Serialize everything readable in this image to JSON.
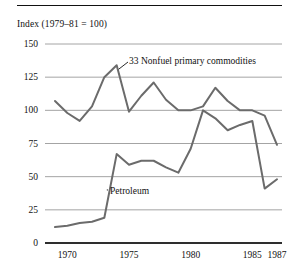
{
  "chart_data": {
    "type": "line",
    "title": "",
    "ylabel": "Index (1979–81 = 100)",
    "xlabel": "",
    "ylim": [
      0,
      150
    ],
    "xlim": [
      1969,
      1987
    ],
    "yticks": [
      0,
      25,
      50,
      75,
      100,
      125,
      150
    ],
    "ytick_labels": [
      "0",
      "25",
      "50",
      "75",
      "100",
      "125",
      "150"
    ],
    "xticks": [
      1970,
      1975,
      1980,
      1985,
      1987
    ],
    "xtick_labels": [
      "1970",
      "1975",
      "1980",
      "1985",
      "1987"
    ],
    "grid": "horizontal",
    "legend": "inline-annotations",
    "x": [
      1969,
      1970,
      1971,
      1972,
      1973,
      1974,
      1975,
      1976,
      1977,
      1978,
      1979,
      1980,
      1981,
      1982,
      1983,
      1984,
      1985,
      1986,
      1987
    ],
    "series": [
      {
        "name": "33 Nonfuel primary commodities",
        "color": "#6b6b6b",
        "values": [
          107,
          98,
          92,
          103,
          125,
          134,
          99,
          111,
          121,
          108,
          100,
          100,
          103,
          117,
          107,
          100,
          100,
          96,
          74
        ]
      },
      {
        "name": "Petroleum",
        "color": "#6b6b6b",
        "values": [
          12,
          13,
          15,
          16,
          19,
          67,
          59,
          62,
          62,
          57,
          53,
          71,
          100,
          94,
          85,
          89,
          92,
          41,
          48
        ]
      }
    ],
    "annotations": [
      {
        "text": "33 Nonfuel primary commodities",
        "target_x": 1974,
        "target_y": 134
      },
      {
        "text": "Petroleum",
        "target_x": 1973.2,
        "target_y": 40
      }
    ]
  },
  "axis_title": "Index (1979–81 = 100)",
  "annotations": {
    "nonfuel": "33 Nonfuel primary commodities",
    "petroleum": "Petroleum"
  },
  "colors": {
    "line": "#6b6b6b",
    "grid": "#9a9a9a",
    "axis": "#111111",
    "text": "#111111"
  }
}
